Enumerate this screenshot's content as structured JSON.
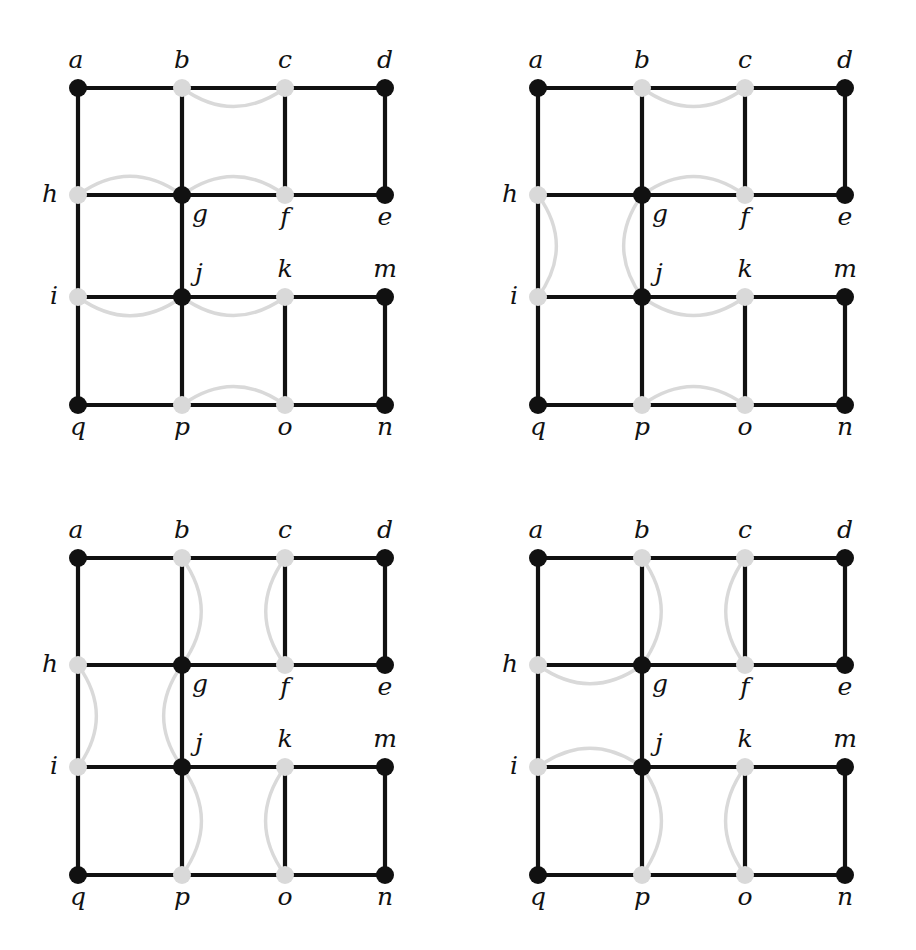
{
  "figure": {
    "node_label_order": [
      "a",
      "b",
      "c",
      "d",
      "e",
      "f",
      "g",
      "h",
      "i",
      "j",
      "k",
      "m",
      "n",
      "o",
      "p",
      "q"
    ],
    "colors": {
      "background": "#ffffff",
      "black_node": "#111111",
      "gray_node": "#d9d9d9",
      "black_edge": "#111111",
      "gray_arc": "#d9d9d9",
      "label": "#111111"
    },
    "geometry": {
      "columns_x": [
        78,
        182,
        285,
        385
      ],
      "rows_y": [
        88,
        195,
        297,
        405
      ],
      "node_radius_black": 9,
      "node_radius_gray": 9,
      "panel_width": 450,
      "panel_height": 470
    },
    "nodes": [
      {
        "id": "a",
        "col": 0,
        "row": 0,
        "color": "black",
        "label": "a",
        "label_pos": "above-left"
      },
      {
        "id": "b",
        "col": 1,
        "row": 0,
        "color": "gray",
        "label": "b",
        "label_pos": "above"
      },
      {
        "id": "c",
        "col": 2,
        "row": 0,
        "color": "gray",
        "label": "c",
        "label_pos": "above"
      },
      {
        "id": "d",
        "col": 3,
        "row": 0,
        "color": "black",
        "label": "d",
        "label_pos": "above"
      },
      {
        "id": "h",
        "col": 0,
        "row": 1,
        "color": "gray",
        "label": "h",
        "label_pos": "left"
      },
      {
        "id": "g",
        "col": 1,
        "row": 1,
        "color": "black",
        "label": "g",
        "label_pos": "below-right"
      },
      {
        "id": "f",
        "col": 2,
        "row": 1,
        "color": "gray",
        "label": "f",
        "label_pos": "below"
      },
      {
        "id": "e",
        "col": 3,
        "row": 1,
        "color": "black",
        "label": "e",
        "label_pos": "below"
      },
      {
        "id": "i",
        "col": 0,
        "row": 2,
        "color": "gray",
        "label": "i",
        "label_pos": "left"
      },
      {
        "id": "j",
        "col": 1,
        "row": 2,
        "color": "black",
        "label": "j",
        "label_pos": "above-right"
      },
      {
        "id": "k",
        "col": 2,
        "row": 2,
        "color": "gray",
        "label": "k",
        "label_pos": "above"
      },
      {
        "id": "m",
        "col": 3,
        "row": 2,
        "color": "black",
        "label": "m",
        "label_pos": "above"
      },
      {
        "id": "q",
        "col": 0,
        "row": 3,
        "color": "black",
        "label": "q",
        "label_pos": "below"
      },
      {
        "id": "p",
        "col": 1,
        "row": 3,
        "color": "gray",
        "label": "p",
        "label_pos": "below"
      },
      {
        "id": "o",
        "col": 2,
        "row": 3,
        "color": "gray",
        "label": "o",
        "label_pos": "below"
      },
      {
        "id": "n",
        "col": 3,
        "row": 3,
        "color": "black",
        "label": "n",
        "label_pos": "below"
      }
    ],
    "base_edges": [
      [
        "a",
        "b"
      ],
      [
        "b",
        "c"
      ],
      [
        "c",
        "d"
      ],
      [
        "h",
        "g"
      ],
      [
        "g",
        "f"
      ],
      [
        "f",
        "e"
      ],
      [
        "i",
        "j"
      ],
      [
        "j",
        "k"
      ],
      [
        "k",
        "m"
      ],
      [
        "q",
        "p"
      ],
      [
        "p",
        "o"
      ],
      [
        "o",
        "n"
      ],
      [
        "a",
        "h"
      ],
      [
        "h",
        "i"
      ],
      [
        "i",
        "q"
      ],
      [
        "b",
        "g"
      ],
      [
        "g",
        "j"
      ],
      [
        "j",
        "p"
      ],
      [
        "c",
        "f"
      ],
      [
        "k",
        "o"
      ],
      [
        "d",
        "e"
      ],
      [
        "m",
        "n"
      ]
    ],
    "panels": [
      {
        "id": "panel-1",
        "position": "top-left",
        "arcs": [
          {
            "from": "b",
            "to": "c",
            "orientation": "horizontal",
            "bulge": "down"
          },
          {
            "from": "h",
            "to": "g",
            "orientation": "horizontal",
            "bulge": "up"
          },
          {
            "from": "g",
            "to": "f",
            "orientation": "horizontal",
            "bulge": "up"
          },
          {
            "from": "i",
            "to": "j",
            "orientation": "horizontal",
            "bulge": "down"
          },
          {
            "from": "j",
            "to": "k",
            "orientation": "horizontal",
            "bulge": "down"
          },
          {
            "from": "p",
            "to": "o",
            "orientation": "horizontal",
            "bulge": "up"
          }
        ]
      },
      {
        "id": "panel-2",
        "position": "top-right",
        "arcs": [
          {
            "from": "b",
            "to": "c",
            "orientation": "horizontal",
            "bulge": "down"
          },
          {
            "from": "g",
            "to": "f",
            "orientation": "horizontal",
            "bulge": "up"
          },
          {
            "from": "h",
            "to": "i",
            "orientation": "vertical",
            "bulge": "right"
          },
          {
            "from": "g",
            "to": "j",
            "orientation": "vertical",
            "bulge": "left"
          },
          {
            "from": "j",
            "to": "k",
            "orientation": "horizontal",
            "bulge": "down"
          },
          {
            "from": "p",
            "to": "o",
            "orientation": "horizontal",
            "bulge": "up"
          }
        ]
      },
      {
        "id": "panel-3",
        "position": "bottom-left",
        "arcs": [
          {
            "from": "b",
            "to": "g",
            "orientation": "vertical",
            "bulge": "right"
          },
          {
            "from": "c",
            "to": "f",
            "orientation": "vertical",
            "bulge": "left"
          },
          {
            "from": "h",
            "to": "i",
            "orientation": "vertical",
            "bulge": "right"
          },
          {
            "from": "g",
            "to": "j",
            "orientation": "vertical",
            "bulge": "left"
          },
          {
            "from": "j",
            "to": "p",
            "orientation": "vertical",
            "bulge": "right"
          },
          {
            "from": "k",
            "to": "o",
            "orientation": "vertical",
            "bulge": "left"
          }
        ]
      },
      {
        "id": "panel-4",
        "position": "bottom-right",
        "arcs": [
          {
            "from": "b",
            "to": "g",
            "orientation": "vertical",
            "bulge": "right"
          },
          {
            "from": "c",
            "to": "f",
            "orientation": "vertical",
            "bulge": "left"
          },
          {
            "from": "h",
            "to": "g",
            "orientation": "horizontal",
            "bulge": "down"
          },
          {
            "from": "i",
            "to": "j",
            "orientation": "horizontal",
            "bulge": "up"
          },
          {
            "from": "j",
            "to": "p",
            "orientation": "vertical",
            "bulge": "right"
          },
          {
            "from": "k",
            "to": "o",
            "orientation": "vertical",
            "bulge": "left"
          }
        ]
      }
    ],
    "panel_offsets": [
      {
        "id": "panel-1",
        "left": 0,
        "top": 0
      },
      {
        "id": "panel-2",
        "left": 460,
        "top": 0
      },
      {
        "id": "panel-3",
        "left": 0,
        "top": 470
      },
      {
        "id": "panel-4",
        "left": 460,
        "top": 470
      }
    ]
  }
}
